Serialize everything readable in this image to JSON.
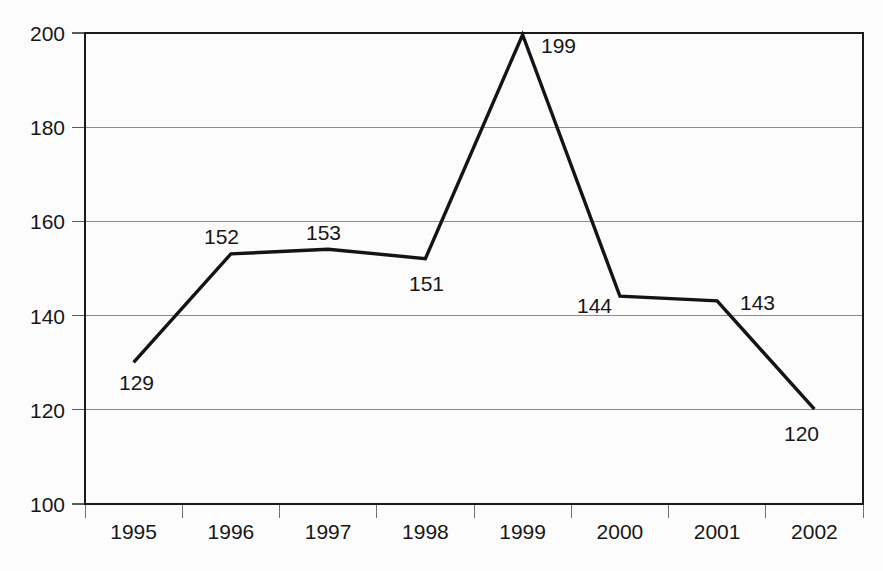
{
  "chart_data": {
    "type": "line",
    "title": "",
    "subtitle": "",
    "xlabel": "",
    "ylabel": "",
    "categories": [
      "1995",
      "1996",
      "1997",
      "1998",
      "1999",
      "2000",
      "2001",
      "2002"
    ],
    "x": [
      1995,
      1996,
      1997,
      1998,
      1999,
      2000,
      2001,
      2002
    ],
    "values": [
      129,
      152,
      153,
      151,
      199,
      144,
      143,
      120
    ],
    "data_labels": [
      "129",
      "152",
      "153",
      "151",
      "199",
      "144",
      "143",
      "120"
    ],
    "series": [
      {
        "name": "",
        "values": [
          129,
          152,
          153,
          151,
          199,
          144,
          143,
          120
        ]
      }
    ],
    "ylim": [
      100,
      200
    ],
    "yticks": [
      100,
      120,
      140,
      160,
      180,
      200
    ],
    "ytick_labels": [
      "100",
      "120",
      "140",
      "160",
      "180",
      "200"
    ],
    "xlim": [
      1994.5,
      2002.5
    ],
    "grid": "horizontal",
    "legend": "none",
    "line_color": "#141414",
    "grid_color": "#8d8d8d",
    "axis_color": "#1a1a1a",
    "background_color": "#fcfcfc",
    "text_color": "#171717",
    "markers": "none"
  },
  "geometry": {
    "plot_left": 85,
    "plot_right": 863,
    "plot_top": 33,
    "plot_bottom": 504,
    "band_width": 97.25,
    "point_x": [
      133.6,
      230.9,
      328.1,
      425.4,
      522.6,
      619.9,
      717.1,
      814.4
    ],
    "point_y": [
      362.3,
      253.9,
      249.2,
      258.6,
      34.7,
      296.2,
      300.9,
      409.2
    ],
    "label_positions": [
      {
        "value": "129",
        "x": 119,
        "y": 390,
        "anchor": "start"
      },
      {
        "value": "152",
        "x": 204,
        "y": 244,
        "anchor": "start"
      },
      {
        "value": "153",
        "x": 306,
        "y": 240,
        "anchor": "start"
      },
      {
        "value": "151",
        "x": 409,
        "y": 291,
        "anchor": "start"
      },
      {
        "value": "199",
        "x": 541,
        "y": 53,
        "anchor": "start"
      },
      {
        "value": "144",
        "x": 577,
        "y": 313,
        "anchor": "start"
      },
      {
        "value": "143",
        "x": 740,
        "y": 310,
        "anchor": "start"
      },
      {
        "value": "120",
        "x": 784,
        "y": 441,
        "anchor": "start"
      }
    ],
    "ytick_y": [
      504,
      409.8,
      315.6,
      221.4,
      127.2,
      33
    ],
    "xtick_x": [
      85,
      182.25,
      279.5,
      376.75,
      474,
      571.25,
      668.5,
      765.75,
      863
    ],
    "xlabel_x": [
      133.6,
      230.9,
      328.1,
      425.4,
      522.6,
      619.9,
      717.1,
      814.4
    ],
    "xlabel_y": 539
  }
}
